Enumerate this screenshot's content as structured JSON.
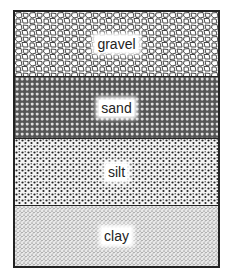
{
  "diagram": {
    "layers": [
      {
        "label": "gravel",
        "pattern": "large-irregular-stones"
      },
      {
        "label": "sand",
        "pattern": "dense-small-cells"
      },
      {
        "label": "silt",
        "pattern": "medium-dots"
      },
      {
        "label": "clay",
        "pattern": "fine-stipple"
      }
    ],
    "colors": {
      "ink": "#222222",
      "background": "#ffffff"
    }
  }
}
